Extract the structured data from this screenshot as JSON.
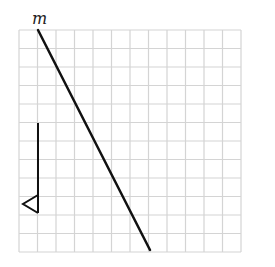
{
  "figure": {
    "type": "grid-diagram",
    "grid": {
      "origin_x": 19,
      "origin_y": 30,
      "cell_size": 18.5,
      "columns": 12,
      "rows": 12,
      "line_color": "#d4d4d4"
    },
    "line_m": {
      "label": "m",
      "x1": 38,
      "y1": 30,
      "x2": 150,
      "y2": 250,
      "color": "#111111"
    },
    "vertical_segment": {
      "x": 38,
      "y1": 123,
      "y2": 213,
      "color": "#111111"
    },
    "triangle": {
      "points": "38,195 23,204 38,213",
      "color": "#111111"
    }
  }
}
